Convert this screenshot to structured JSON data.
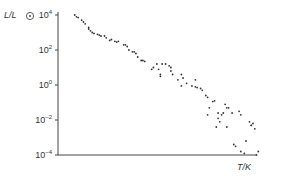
{
  "chart_data": {
    "type": "scatter",
    "title": "",
    "xlabel": "T/K",
    "ylabel": "L/L☉",
    "yscale": "log",
    "ylim_log10": [
      -4,
      4.6
    ],
    "yticks": [
      {
        "label": "10",
        "exp": "4",
        "value_log10": 4
      },
      {
        "label": "10",
        "exp": "2",
        "value_log10": 2
      },
      {
        "label": "10",
        "exp": "0",
        "value_log10": 0
      },
      {
        "label": "10",
        "exp": "−2",
        "value_log10": -2
      },
      {
        "label": "10",
        "exp": "−4",
        "value_log10": -4
      }
    ],
    "xticks": [],
    "x_direction": "decreasing temperature to the right (x values in plot-fraction 0–1)",
    "grid": false,
    "legend": null,
    "points": [
      [
        0.05,
        4.0
      ],
      [
        0.06,
        3.9
      ],
      [
        0.07,
        3.85
      ],
      [
        0.09,
        3.7
      ],
      [
        0.1,
        3.6
      ],
      [
        0.11,
        3.5
      ],
      [
        0.13,
        3.3
      ],
      [
        0.13,
        3.2
      ],
      [
        0.14,
        3.1
      ],
      [
        0.15,
        3.0
      ],
      [
        0.16,
        2.95
      ],
      [
        0.18,
        2.9
      ],
      [
        0.19,
        2.85
      ],
      [
        0.2,
        2.8
      ],
      [
        0.22,
        2.8
      ],
      [
        0.23,
        2.7
      ],
      [
        0.25,
        2.55
      ],
      [
        0.26,
        2.6
      ],
      [
        0.28,
        2.5
      ],
      [
        0.29,
        2.45
      ],
      [
        0.3,
        2.5
      ],
      [
        0.33,
        2.3
      ],
      [
        0.34,
        2.3
      ],
      [
        0.35,
        2.2
      ],
      [
        0.36,
        2.0
      ],
      [
        0.38,
        1.9
      ],
      [
        0.39,
        1.9
      ],
      [
        0.4,
        1.8
      ],
      [
        0.41,
        1.6
      ],
      [
        0.43,
        1.4
      ],
      [
        0.44,
        1.4
      ],
      [
        0.45,
        1.35
      ],
      [
        0.49,
        0.9
      ],
      [
        0.5,
        1.0
      ],
      [
        0.52,
        1.2
      ],
      [
        0.53,
        0.9
      ],
      [
        0.54,
        0.6
      ],
      [
        0.54,
        0.5
      ],
      [
        0.55,
        1.2
      ],
      [
        0.57,
        1.2
      ],
      [
        0.59,
        1.1
      ],
      [
        0.6,
        0.8
      ],
      [
        0.6,
        1.0
      ],
      [
        0.61,
        0.6
      ],
      [
        0.64,
        0.3
      ],
      [
        0.66,
        0.6
      ],
      [
        0.66,
        -0.05
      ],
      [
        0.67,
        0.4
      ],
      [
        0.69,
        0.1
      ],
      [
        0.72,
        -0.05
      ],
      [
        0.74,
        -0.1
      ],
      [
        0.74,
        0.3
      ],
      [
        0.75,
        -0.15
      ],
      [
        0.77,
        -0.2
      ],
      [
        0.78,
        -0.3
      ],
      [
        0.8,
        -0.6
      ],
      [
        0.81,
        -0.7
      ],
      [
        0.81,
        -1.7
      ],
      [
        0.82,
        -1.3
      ],
      [
        0.84,
        -0.95
      ],
      [
        0.85,
        -0.9
      ],
      [
        0.86,
        -2.4
      ],
      [
        0.87,
        -1.6
      ],
      [
        0.87,
        -1.9
      ],
      [
        0.88,
        -2.1
      ],
      [
        0.89,
        -1.7
      ],
      [
        0.9,
        -1.6
      ],
      [
        0.91,
        -1.1
      ],
      [
        0.92,
        -1.3
      ],
      [
        0.92,
        -2.4
      ],
      [
        0.93,
        -1.3
      ],
      [
        0.95,
        -1.6
      ],
      [
        0.96,
        -3.4
      ],
      [
        0.97,
        -3.5
      ],
      [
        0.99,
        -1.5
      ],
      [
        1.0,
        -1.7
      ],
      [
        1.0,
        -3.8
      ],
      [
        1.02,
        -3.9
      ],
      [
        1.03,
        -3.2
      ],
      [
        1.05,
        -2.1
      ],
      [
        1.06,
        -2.3
      ],
      [
        1.06,
        -2.3
      ],
      [
        1.07,
        -2.2
      ],
      [
        1.08,
        -2.5
      ],
      [
        1.09,
        -4.0
      ],
      [
        1.1,
        -3.8
      ]
    ]
  },
  "axes": {
    "y_label_main": "L/L",
    "y_label_sub": "⊙",
    "x_label": "T/K"
  }
}
